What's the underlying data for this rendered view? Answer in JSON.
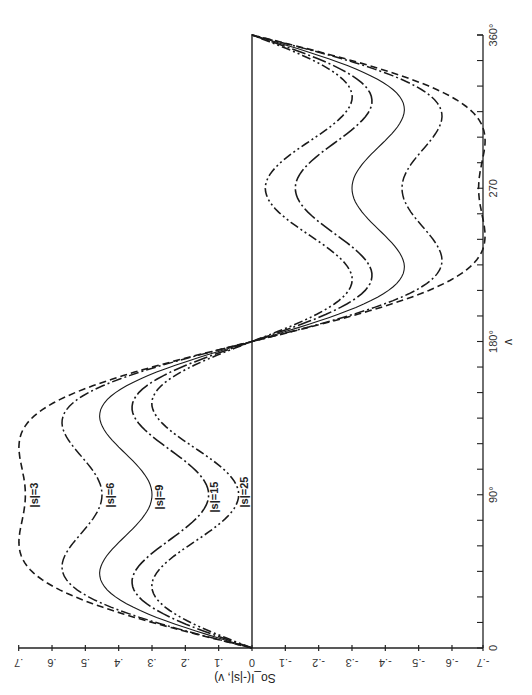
{
  "chart_data": {
    "type": "line",
    "title": "",
    "xlabel": "v",
    "ylabel": "So_I(-|s|, v)",
    "orientation_note": "figure printed rotated: v axis vertical on right (0 at bottom, 360° at top); So axis horizontal along bottom (.7 at left, -.7 at right)",
    "xlim": [
      0,
      360
    ],
    "ylim": [
      -0.7,
      0.7
    ],
    "grid": false,
    "legend": "inline labels",
    "x_ticks": [
      {
        "value": 0,
        "label": "0"
      },
      {
        "value": 90,
        "label": "90°"
      },
      {
        "value": 180,
        "label": "180°"
      },
      {
        "value": 270,
        "label": "270"
      },
      {
        "value": 360,
        "label": "360°"
      }
    ],
    "y_ticks": [
      {
        "value": 0.7,
        "label": ".7"
      },
      {
        "value": 0.6,
        "label": ".6"
      },
      {
        "value": 0.5,
        "label": ".5"
      },
      {
        "value": 0.4,
        "label": ".4"
      },
      {
        "value": 0.3,
        "label": ".3"
      },
      {
        "value": 0.2,
        "label": ".2"
      },
      {
        "value": 0.1,
        "label": ".1"
      },
      {
        "value": 0.0,
        "label": "0"
      },
      {
        "value": -0.1,
        "label": "-.1"
      },
      {
        "value": -0.2,
        "label": "-.2"
      },
      {
        "value": -0.3,
        "label": "-.3"
      },
      {
        "value": -0.4,
        "label": "-.4"
      },
      {
        "value": -0.5,
        "label": "-.5"
      },
      {
        "value": -0.6,
        "label": "-.6"
      },
      {
        "value": -0.7,
        "label": "-.7"
      }
    ],
    "x": [
      0,
      15,
      30,
      45,
      60,
      75,
      90,
      105,
      120,
      135,
      150,
      165,
      180,
      195,
      210,
      225,
      240,
      255,
      270,
      285,
      300,
      315,
      330,
      345,
      360
    ],
    "series": [
      {
        "name": "|s|=3",
        "style": "dashed",
        "a": 0.807,
        "b": 0.127,
        "values": [
          0,
          0.3,
          0.53,
          0.66,
          0.7,
          0.69,
          0.68,
          0.69,
          0.7,
          0.66,
          0.53,
          0.3,
          0,
          -0.3,
          -0.53,
          -0.66,
          -0.7,
          -0.69,
          -0.68,
          -0.69,
          -0.7,
          -0.66,
          -0.53,
          -0.3,
          0
        ]
      },
      {
        "name": "|s|=6",
        "style": "dash-dot",
        "a": 0.627,
        "b": 0.177,
        "values": [
          0,
          0.29,
          0.49,
          0.57,
          0.54,
          0.48,
          0.45,
          0.48,
          0.54,
          0.57,
          0.49,
          0.29,
          0,
          -0.29,
          -0.49,
          -0.57,
          -0.54,
          -0.48,
          -0.45,
          -0.48,
          -0.54,
          -0.57,
          -0.49,
          -0.29,
          0
        ]
      },
      {
        "name": "|s|=9",
        "style": "solid",
        "a": 0.473,
        "b": 0.173,
        "values": [
          0,
          0.25,
          0.41,
          0.45,
          0.41,
          0.34,
          0.3,
          0.34,
          0.41,
          0.45,
          0.41,
          0.25,
          0,
          -0.25,
          -0.41,
          -0.45,
          -0.41,
          -0.34,
          -0.3,
          -0.34,
          -0.41,
          -0.45,
          -0.41,
          -0.25,
          0
        ]
      },
      {
        "name": "|s|=15",
        "style": "long-dash-dot",
        "a": 0.313,
        "b": 0.183,
        "values": [
          0,
          0.21,
          0.34,
          0.35,
          0.27,
          0.18,
          0.13,
          0.18,
          0.27,
          0.35,
          0.34,
          0.21,
          0,
          -0.21,
          -0.34,
          -0.35,
          -0.27,
          -0.18,
          -0.13,
          -0.18,
          -0.27,
          -0.35,
          -0.34,
          -0.21,
          0
        ]
      },
      {
        "name": "|s|=25",
        "style": "dash-dot-dot",
        "a": 0.22,
        "b": 0.18,
        "values": [
          0,
          0.18,
          0.29,
          0.28,
          0.19,
          0.1,
          0.04,
          0.1,
          0.19,
          0.28,
          0.29,
          0.18,
          0,
          -0.18,
          -0.29,
          -0.28,
          -0.19,
          -0.1,
          -0.04,
          -0.1,
          -0.19,
          -0.28,
          -0.29,
          -0.18,
          0
        ]
      }
    ],
    "annotations": [
      "|s|=3",
      "|s|=6",
      "|s|=9",
      "|s|=15",
      "|s|=25"
    ]
  },
  "labels": {
    "xlabel": "v",
    "ylabel": "So_I(-|s|, v)",
    "curve_labels": [
      "|s|=3",
      "|s|=6",
      "|s|=9",
      "|s|=15",
      "|s|=25"
    ]
  }
}
